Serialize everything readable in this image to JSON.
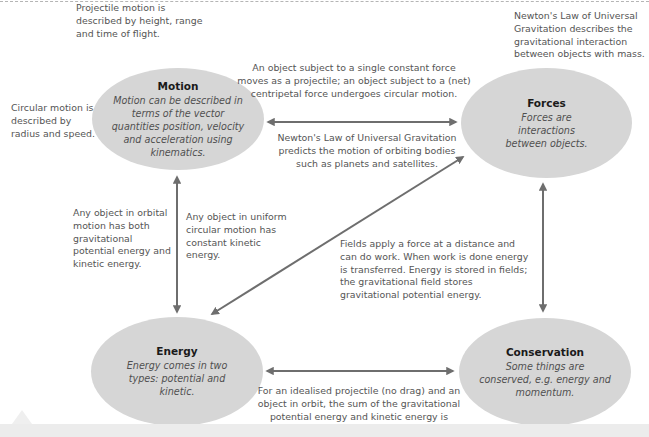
{
  "nodes": {
    "motion": {
      "title": "Motion",
      "description": "Motion can be described in terms of the vector quantities position, velocity and acceleration using kinematics."
    },
    "forces": {
      "title": "Forces",
      "description": "Forces are interactions between objects."
    },
    "energy": {
      "title": "Energy",
      "description": "Energy comes in two types: potential and kinetic."
    },
    "conservation": {
      "title": "Conservation",
      "description": "Some things are conserved, e.g. energy and momentum."
    }
  },
  "notes": {
    "projectile": "Projectile motion is described by height, range and time of flight.",
    "circular": "Circular motion is described by radius and speed.",
    "gravitation_forces": "Newton's Law of Universal Gravitation describes the gravitational interaction between objects with mass.",
    "motion_forces": "An object subject to a single constant force moves as a projectile; an object subject to a (net) centripetal force undergoes circular motion.",
    "orbit_prediction": "Newton's Law of Universal Gravitation predicts the motion of orbiting bodies such as planets and satellites.",
    "orbital_energy": "Any object in orbital motion has both gravitational potential energy and kinetic energy.",
    "uniform_circular": "Any object in uniform circular motion has constant kinetic energy.",
    "fields": "Fields apply a force at a distance and can do work. When work is done energy is transferred. Energy is stored in fields; the gravitational field stores gravitational potential energy.",
    "conservation_link": "For an idealised projectile (no drag) and an object in orbit, the sum of the gravitational potential energy and kinetic energy is constant."
  },
  "colors": {
    "node_fill": "#d6d6d6",
    "arrow": "#6e6e6e",
    "text": "#555555",
    "title": "#1a1a1a"
  }
}
